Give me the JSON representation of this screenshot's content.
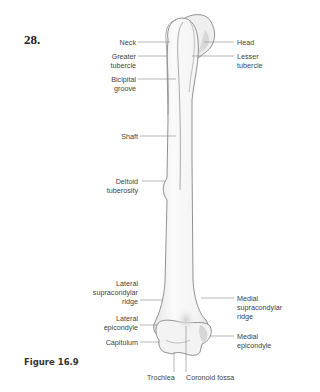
{
  "question_number": "28.",
  "figure_caption": "Figure 16.9",
  "diagram": {
    "labels_left": {
      "neck": "Neck",
      "greater_tubercle_1": "Greater",
      "greater_tubercle_2": "tubercle",
      "bicipital_groove_1": "Bicipital",
      "bicipital_groove_2": "groove",
      "shaft": "Shaft",
      "deltoid_tuberosity_1": "Deltoid",
      "deltoid_tuberosity_2": "tuberosity",
      "lateral_supracondylar_1": "Lateral",
      "lateral_supracondylar_2": "supracondylar",
      "lateral_supracondylar_3": "ridge",
      "lateral_epicondyle_1": "Lateral",
      "lateral_epicondyle_2": "epicondyle",
      "capitulum": "Capitulum"
    },
    "labels_right": {
      "head": "Head",
      "lesser_tubercle_1": "Lesser",
      "lesser_tubercle_2": "tubercle",
      "medial_supracondylar_1": "Medial",
      "medial_supracondylar_2": "supracondylar",
      "medial_supracondylar_3": "ridge",
      "medial_epicondyle_1": "Medial",
      "medial_epicondyle_2": "epicondyle"
    },
    "labels_bottom": {
      "trochlea": "Trochlea",
      "coronoid_fossa": "Coronoid fossa"
    },
    "colors": {
      "bone_fill": "#f2f2f2",
      "bone_shade": "#dcdcdc",
      "outline": "#777777",
      "leader": "#888888",
      "text": "#444444"
    }
  }
}
